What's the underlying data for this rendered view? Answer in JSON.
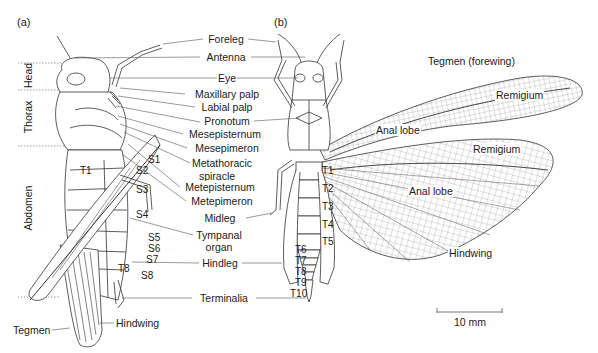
{
  "figure": {
    "panels": [
      {
        "id": "a",
        "label": "(a)"
      },
      {
        "id": "b",
        "label": "(b)"
      }
    ],
    "body_regions": [
      {
        "name": "Head"
      },
      {
        "name": "Thorax"
      },
      {
        "name": "Abdomen"
      }
    ],
    "center_labels": [
      "Foreleg",
      "Antenna",
      "Eye",
      "Maxillary palp",
      "Labial palp",
      "Pronotum",
      "Mesepisternum",
      "Mesepimeron",
      "Metathoracic",
      "spiracle",
      "Metepisternum",
      "Metepimeron",
      "Midleg",
      "Tympanal",
      "organ",
      "Hindleg",
      "Terminalia"
    ],
    "lateral_view": {
      "sternites": [
        "S1",
        "S2",
        "S3",
        "S4",
        "S5",
        "S6",
        "S7",
        "S8"
      ],
      "tergites": [
        "T1",
        "T8"
      ],
      "bottom_labels": [
        "Tegmen",
        "Hindwing"
      ]
    },
    "dorsal_view": {
      "tergites": [
        "T1",
        "T2",
        "T3",
        "T4",
        "T5",
        "T6",
        "T7",
        "T8",
        "T9",
        "T10"
      ],
      "wing_labels": {
        "tegmen_title": "Tegmen (forewing)",
        "remigium_fore": "Remigium",
        "anal_lobe_fore": "Anal lobe",
        "remigium_hind": "Remigium",
        "anal_lobe_hind": "Anal lobe",
        "hindwing": "Hindwing"
      }
    },
    "scale_bar": {
      "label": "10 mm"
    },
    "colors": {
      "line": "#333333",
      "leader": "#555555",
      "dotted": "#888888",
      "background": "#ffffff"
    }
  }
}
